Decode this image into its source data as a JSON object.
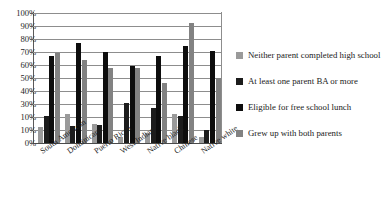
{
  "chart_data": {
    "type": "bar",
    "title": "",
    "subtitle": "",
    "xlabel": "",
    "ylabel": "",
    "ylim": [
      0,
      100
    ],
    "grid": true,
    "legend_position": "right",
    "y_ticks": [
      "0%",
      "10%",
      "10%",
      "30%",
      "40%",
      "50%",
      "60%",
      "70%",
      "80%",
      "90%",
      "100%"
    ],
    "y_tick_values": [
      0,
      10,
      20,
      30,
      40,
      50,
      60,
      70,
      80,
      90,
      100
    ],
    "categories": [
      "South American",
      "Dominican",
      "Puerto Rican",
      "West Indian",
      "Native black",
      "Chinese",
      "Native white"
    ],
    "series": [
      {
        "name": "Neither parent completed high school",
        "color": "#9a9a9a",
        "values": [
          12,
          22,
          15,
          5,
          8,
          22,
          5
        ]
      },
      {
        "name": "At least one parent BA or more",
        "color": "#1c1c1c",
        "values": [
          21,
          13,
          14,
          31,
          27,
          21,
          10
        ]
      },
      {
        "name": "Eligible for free school lunch",
        "color": "#0d0d0d",
        "values": [
          67,
          77,
          70,
          59,
          67,
          75,
          71
        ]
      },
      {
        "name": "Grew up with both parents",
        "color": "#828282",
        "values": [
          69,
          64,
          58,
          58,
          46,
          92,
          50
        ]
      }
    ]
  },
  "legend": {
    "items": [
      {
        "label": "Neither parent completed high school",
        "color": "#9a9a9a"
      },
      {
        "label": "At least one parent BA or more",
        "color": "#1c1c1c"
      },
      {
        "label": "Eligible for free school lunch",
        "color": "#0d0d0d"
      },
      {
        "label": "Grew up with both parents",
        "color": "#828282"
      }
    ]
  }
}
